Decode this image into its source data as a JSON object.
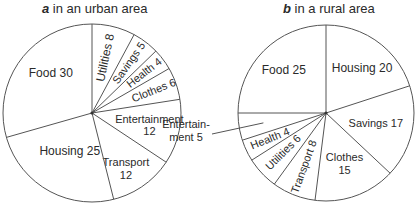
{
  "chart_data": [
    {
      "type": "pie",
      "panel_letter": "a",
      "title": "in an urban area",
      "start": "12 o'clock, clockwise",
      "slices": [
        {
          "label": "Utilities",
          "value": 8
        },
        {
          "label": "Savings",
          "value": 5
        },
        {
          "label": "Health",
          "value": 4
        },
        {
          "label": "Clothes",
          "value": 6
        },
        {
          "label": "Entertainment",
          "value": 12
        },
        {
          "label": "Transport",
          "value": 12
        },
        {
          "label": "Housing",
          "value": 25
        },
        {
          "label": "Food",
          "value": 30
        }
      ]
    },
    {
      "type": "pie",
      "panel_letter": "b",
      "title": "in a rural area",
      "start": "12 o'clock, clockwise",
      "slices": [
        {
          "label": "Housing",
          "value": 20
        },
        {
          "label": "Savings",
          "value": 17
        },
        {
          "label": "Clothes",
          "value": 15
        },
        {
          "label": "Transport",
          "value": 8
        },
        {
          "label": "Utilities",
          "value": 6
        },
        {
          "label": "Health",
          "value": 4
        },
        {
          "label": "Entertainment",
          "value": 5,
          "display_label": "Entertain-\nment 5",
          "external_label": true
        },
        {
          "label": "Food",
          "value": 25
        }
      ]
    }
  ]
}
